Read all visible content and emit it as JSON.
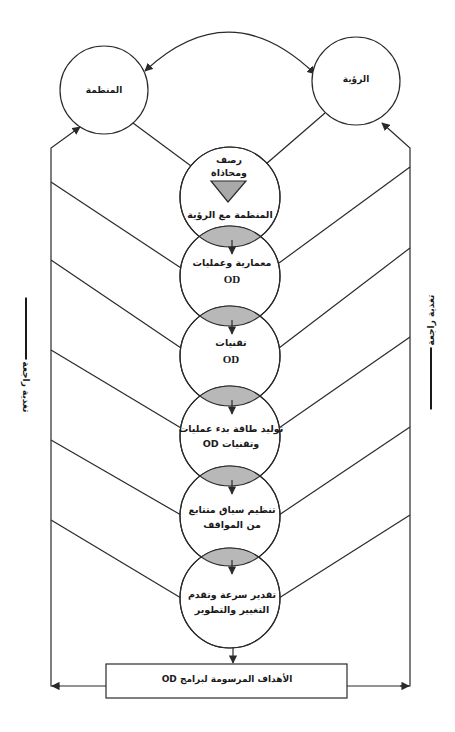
{
  "diagram": {
    "top_nodes": {
      "organization": "المنظمة",
      "vision": "الرؤية"
    },
    "chain": [
      {
        "line1": "رصف",
        "line2": "ومحاذاة",
        "line3": "المنظمة مع الرؤية"
      },
      {
        "line1": "معمارية وعمليات",
        "line2": "OD"
      },
      {
        "line1": "تقنيات",
        "line2": "OD"
      },
      {
        "line1": "توليد طاقة بدء عمليات",
        "line2": "وتقنيات OD"
      },
      {
        "line1": "تنظيم سياق متتابع",
        "line2": "من المواقف"
      },
      {
        "line1": "تقدير سرعة وتقدم",
        "line2": "التغيير والتطوير"
      }
    ],
    "goal_box": "الأهداف المرسومة لبرامج OD",
    "feedback_left": "تغذية راجعة",
    "feedback_right": "تغذية راجعة",
    "colors": {
      "stroke": "#2a2a2a",
      "lens_fill": "#b8b8b8",
      "triangle_fill": "#a9a9a9",
      "background": "#ffffff"
    }
  }
}
